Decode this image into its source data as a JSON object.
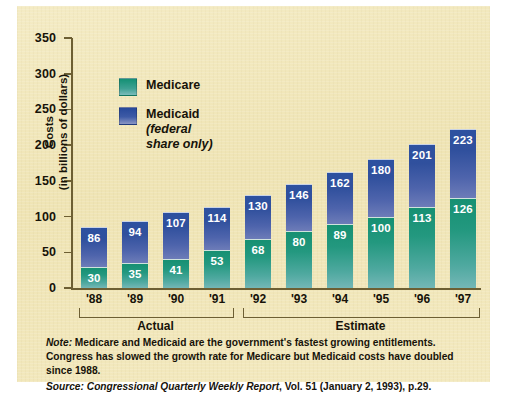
{
  "chart_data": {
    "type": "bar",
    "subtype": "stacked-bar",
    "title": "",
    "xlabel": "",
    "ylabel": "Costs (in billions of dollars)",
    "ylabel_line1": "Costs",
    "ylabel_line2": "(in billions of dollars)",
    "ylim": [
      0,
      350
    ],
    "yticks": [
      0,
      50,
      100,
      150,
      200,
      250,
      300,
      350
    ],
    "ytick_labels": [
      "0",
      "50",
      "100",
      "150",
      "200",
      "250",
      "300",
      "350"
    ],
    "grid": false,
    "legend_position": "upper-left-inside",
    "categories": [
      "'88",
      "'89",
      "'90",
      "'91",
      "'92",
      "'93",
      "'94",
      "'95",
      "'96",
      "'97"
    ],
    "series": [
      {
        "name": "Medicare",
        "color": "#1a9077",
        "values": [
          30,
          35,
          41,
          53,
          68,
          80,
          89,
          100,
          113,
          126
        ]
      },
      {
        "name": "Medicaid",
        "color": "#2d51a0",
        "values": [
          86,
          94,
          107,
          114,
          130,
          146,
          162,
          180,
          201,
          223
        ]
      }
    ],
    "groups": [
      {
        "label": "Actual",
        "categories": [
          "'88",
          "'89",
          "'90",
          "'91"
        ]
      },
      {
        "label": "Estimate",
        "categories": [
          "'92",
          "'93",
          "'94",
          "'95",
          "'96",
          "'97"
        ]
      }
    ],
    "annotations": [
      "Note: Medicare and Medicaid are the government's fastest growing entitlements. Congress has slowed the growth rate for Medicare but Medicaid costs have doubled since 1988.",
      "Source: Congressional Quarterly Weekly Report, Vol. 51 (January 2, 1993), p.29."
    ]
  },
  "legend": {
    "medicare_label": "Medicare",
    "medicaid_label": "Medicaid",
    "medicaid_sub_line1": "(federal",
    "medicaid_sub_line2": "share only)"
  },
  "notes": {
    "note_prefix": "Note:",
    "note_body": " Medicare and Medicaid are the government's fastest growing entitlements. Congress has slowed the growth rate for Medicare but Medicaid costs have doubled since 1988.",
    "source_prefix": "Source:",
    "source_title": " Congressional Quarterly Weekly Report",
    "source_rest": ", Vol. 51 (January 2, 1993), p.29."
  },
  "colors": {
    "panel_background": "#f2e8bd",
    "medicare": "#1a9077",
    "medicaid": "#2d51a0",
    "axis": "#6d5f33",
    "text": "#171309",
    "value_label": "#ffffff"
  }
}
